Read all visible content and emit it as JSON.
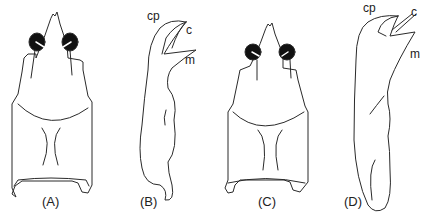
{
  "figure": {
    "panels": [
      {
        "id": "A",
        "label": "(A)",
        "view": "carapace dorsal"
      },
      {
        "id": "B",
        "label": "(B)",
        "view": "appendage lateral",
        "parts": [
          "cp",
          "c",
          "m"
        ]
      },
      {
        "id": "C",
        "label": "(C)",
        "view": "carapace dorsal"
      },
      {
        "id": "D",
        "label": "(D)",
        "view": "appendage lateral",
        "parts": [
          "cp",
          "c",
          "m"
        ]
      }
    ],
    "part_labels": {
      "cp": "cp",
      "c": "c",
      "m": "m"
    },
    "colors": {
      "ink": "#222222",
      "background": "#ffffff"
    }
  }
}
